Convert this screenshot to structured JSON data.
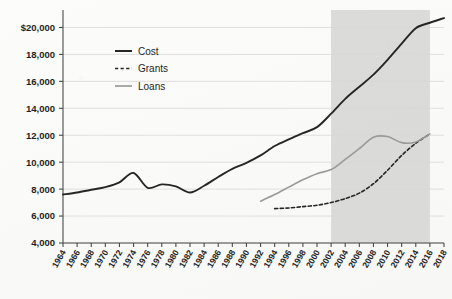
{
  "chart_data": {
    "type": "line",
    "title": "",
    "subtitle": "",
    "xlabel": "",
    "ylabel": "",
    "grid": true,
    "legend_position": "top-left-inside",
    "xlim": [
      1964,
      2018
    ],
    "ylim": [
      4000,
      21000
    ],
    "y_ticks": [
      4000,
      6000,
      8000,
      10000,
      12000,
      14000,
      16000,
      18000,
      20000
    ],
    "y_tick_labels": [
      "4,000",
      "6,000",
      "8,000",
      "10,000",
      "12,000",
      "14,000",
      "16,000",
      "18,000",
      "$20,000"
    ],
    "x_ticks": [
      1964,
      1966,
      1968,
      1970,
      1972,
      1974,
      1976,
      1978,
      1980,
      1982,
      1984,
      1986,
      1988,
      1990,
      1992,
      1994,
      1996,
      1998,
      2000,
      2002,
      2004,
      2006,
      2008,
      2010,
      2012,
      2014,
      2016,
      2018
    ],
    "x_tick_labels": [
      "1964",
      "1966",
      "1968",
      "1970",
      "1972",
      "1974",
      "1976",
      "1978",
      "1980",
      "1982",
      "1984",
      "1986",
      "1988",
      "1990",
      "1992",
      "1994",
      "1996",
      "1998",
      "2000",
      "2002",
      "2004",
      "2006",
      "2008",
      "2010",
      "2012",
      "2014",
      "2016",
      "2018"
    ],
    "colors": {
      "cost": "#262626",
      "grants": "#262626",
      "loans": "#9a9a9a",
      "grid": "#d8d8d6",
      "axis": "#4a4a4a",
      "shaded_band": "#d5d5d3",
      "background": "#f8f8f6",
      "text": "#1f1f1f"
    },
    "shaded_band": {
      "x_start": 2002,
      "x_end": 2016,
      "label": ""
    },
    "series": [
      {
        "name": "Cost",
        "style": "solid",
        "color": "#262626",
        "x": [
          1964,
          1966,
          1968,
          1970,
          1972,
          1974,
          1976,
          1978,
          1980,
          1982,
          1984,
          1986,
          1988,
          1990,
          1992,
          1994,
          1996,
          1998,
          2000,
          2002,
          2004,
          2006,
          2008,
          2010,
          2012,
          2014,
          2016,
          2018
        ],
        "values": [
          7600,
          7750,
          7950,
          8150,
          8500,
          9200,
          8100,
          8350,
          8200,
          7750,
          8250,
          8900,
          9500,
          9950,
          10500,
          11200,
          11700,
          12150,
          12600,
          13600,
          14700,
          15600,
          16500,
          17600,
          18800,
          19950,
          20350,
          20700
        ]
      },
      {
        "name": "Grants",
        "style": "dashed",
        "color": "#262626",
        "x": [
          1994,
          1996,
          1998,
          2000,
          2002,
          2004,
          2006,
          2008,
          2010,
          2012,
          2014,
          2016
        ],
        "values": [
          6550,
          6600,
          6700,
          6800,
          7000,
          7300,
          7700,
          8400,
          9400,
          10500,
          11400,
          12100
        ]
      },
      {
        "name": "Loans",
        "style": "solid",
        "color": "#9a9a9a",
        "x": [
          1992,
          1994,
          1996,
          1998,
          2000,
          2002,
          2004,
          2006,
          2008,
          2010,
          2012,
          2014,
          2016
        ],
        "values": [
          7100,
          7600,
          8150,
          8700,
          9150,
          9450,
          10200,
          11000,
          11850,
          11900,
          11450,
          11500,
          12100
        ]
      }
    ]
  },
  "legend": {
    "items": [
      {
        "label": "Cost",
        "style": "solid",
        "color": "#262626"
      },
      {
        "label": "Grants",
        "style": "dashed",
        "color": "#262626"
      },
      {
        "label": "Loans",
        "style": "solid",
        "color": "#9a9a9a"
      }
    ]
  }
}
